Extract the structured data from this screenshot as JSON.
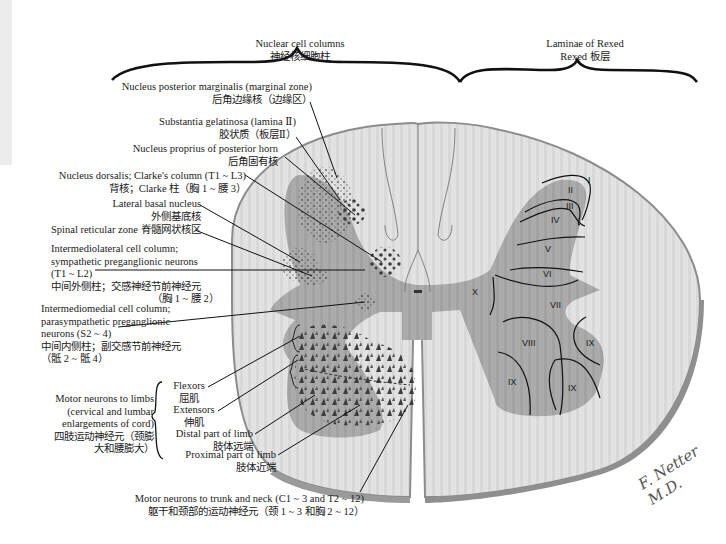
{
  "headers": {
    "nuclear_columns": {
      "en": "Nuclear cell columns",
      "zh": "神经核细胞柱"
    },
    "laminae": {
      "en": "Laminae of Rexed",
      "zh": "Rexed 板层"
    }
  },
  "left_labels": {
    "marginalis": {
      "en": "Nucleus posterior marginalis (marginal zone)",
      "zh": "后角边缘核（边缘区）"
    },
    "gelatinosa": {
      "en": "Substantia gelatinosa (lamina Ⅱ)",
      "zh": "胶状质（板层Ⅱ）"
    },
    "proprius": {
      "en": "Nucleus proprius of posterior horn",
      "zh": "后角固有核"
    },
    "dorsalis": {
      "en": "Nucleus dorsalis; Clarke's column (T1 ~ L3)",
      "zh": "背核；Clarke 柱（胸 1 ~ 腰 3）"
    },
    "lateral_basal": {
      "en": "Lateral basal nucleus",
      "zh": "外侧基底核"
    },
    "reticular": {
      "en": "Spinal reticular zone",
      "zh": "脊髓网状核区"
    },
    "intermediolateral": {
      "en1": "Intermediolateral cell column;",
      "en2": "sympathetic preganglionic neurons",
      "en3": "(T1 ~ L2)",
      "zh1": "中间外侧柱；交感神经节前神经元",
      "zh2": "（胸 1 ~ 腰 2）"
    },
    "intermediomedial": {
      "en1": "Intermediomedial cell column;",
      "en2": "parasympathetic preganglionic",
      "en3": "neurons (S2 ~ 4)",
      "zh1": "中间内侧柱；副交感节前神经元",
      "zh2": "（骶 2 ~ 骶 4）"
    },
    "motor_limbs": {
      "en1": "Motor neurons to limbs",
      "en2": "(cervical and lumbar",
      "en3": "enlargements of cord)",
      "zh1": "四肢运动神经元（颈膨",
      "zh2": "大和腰膨大）"
    },
    "flexors": {
      "en": "Flexors",
      "zh": "屈肌"
    },
    "extensors": {
      "en": "Extensors",
      "zh": "伸肌"
    },
    "distal": {
      "en": "Distal part of limb",
      "zh": "肢体远端"
    },
    "proximal": {
      "en": "Proximal part of limb",
      "zh": "肢体近端"
    },
    "trunk_neck": {
      "en": "Motor neurons to trunk and neck (C1 ~ 3 and T2 ~ 12)",
      "zh": "躯干和颈部的运动神经元（颈 1 ~ 3 和胸 2 ~ 12）"
    }
  },
  "laminae": [
    "I",
    "II",
    "III",
    "IV",
    "V",
    "VI",
    "VII",
    "VIII",
    "IX",
    "IX",
    "IX",
    "X"
  ],
  "signature": "F. Netter M.D.",
  "colors": {
    "white_matter": "#e4e4e4",
    "gray_matter": "#a9a9a9",
    "outline": "#8c8c8c",
    "ink": "#1a1a1a",
    "cells": "#4a4a4a"
  }
}
